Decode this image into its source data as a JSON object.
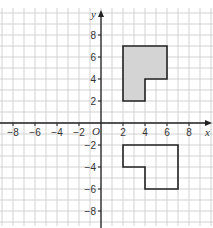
{
  "diagram": {
    "type": "coordinate-grid",
    "axes": {
      "x_label": "x",
      "y_label": "y",
      "origin_label": "O",
      "x_ticks": [
        -8,
        -6,
        -4,
        -2,
        2,
        4,
        6,
        8
      ],
      "y_ticks": [
        8,
        6,
        4,
        2,
        -2,
        -4,
        -6,
        -8
      ],
      "x_range": [
        -9,
        10
      ],
      "y_range": [
        -9,
        9.5
      ]
    },
    "grid": {
      "step": 1,
      "color": "#c8c8c8"
    },
    "shapes": [
      {
        "name": "shaded-l-shape",
        "fill": "#d4d4d4",
        "stroke": "#222222",
        "vertices": [
          [
            2,
            2
          ],
          [
            2,
            7
          ],
          [
            6,
            7
          ],
          [
            6,
            4
          ],
          [
            4,
            4
          ],
          [
            4,
            2
          ]
        ]
      },
      {
        "name": "unshaded-l-shape",
        "fill": "none",
        "stroke": "#222222",
        "vertices": [
          [
            2,
            -2
          ],
          [
            7,
            -2
          ],
          [
            7,
            -6
          ],
          [
            4,
            -6
          ],
          [
            4,
            -4
          ],
          [
            2,
            -4
          ]
        ]
      }
    ]
  }
}
